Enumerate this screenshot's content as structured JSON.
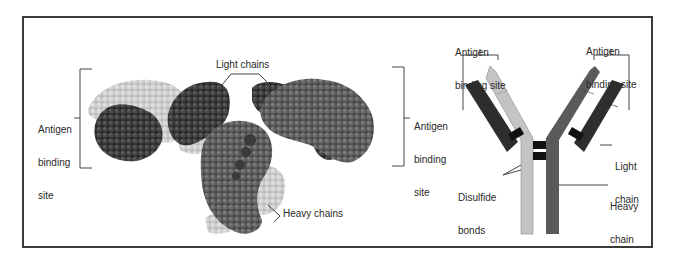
{
  "figure": {
    "left_panel": {
      "title": "Space-filling model of antibody",
      "labels": {
        "antigen_site_left": [
          "Antigen",
          "binding",
          "site"
        ],
        "light_chains": "Light chains",
        "antigen_site_right": [
          "Antigen",
          "binding",
          "site"
        ],
        "heavy_chains": "Heavy chains"
      }
    },
    "right_panel": {
      "title": "Schematic Y-shaped antibody",
      "labels": {
        "antigen_site_left": [
          "Antigen",
          "binding site"
        ],
        "antigen_site_right": [
          "Antigen",
          "binding site"
        ],
        "light_chain": [
          "Light",
          "chain"
        ],
        "disulfide_bonds": [
          "Disulfide",
          "bonds"
        ],
        "heavy_chain": [
          "Heavy",
          "chain"
        ]
      }
    },
    "colors": {
      "frame": "#3a3a3a",
      "light_chain_dark": "#2e2e2e",
      "heavy_chain_mid": "#5a5a5a",
      "heavy_chain_light": "#c4c4c4",
      "bond": "#111111",
      "leader": "#444444"
    }
  }
}
